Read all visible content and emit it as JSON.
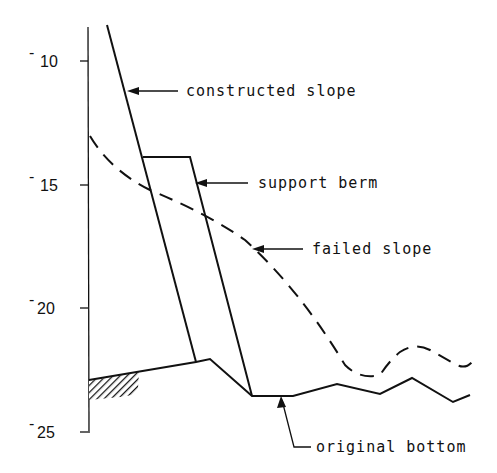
{
  "diagram": {
    "type": "cross-section profile",
    "y_axis": {
      "ticks": [
        {
          "value": "-10",
          "label": "10"
        },
        {
          "value": "-15",
          "label": "15"
        },
        {
          "value": "-20",
          "label": "20"
        },
        {
          "value": "-25",
          "label": "25"
        }
      ]
    },
    "labels": {
      "constructed_slope": "constructed slope",
      "support_berm": "support berm",
      "failed_slope": "failed slope",
      "original_bottom": "original bottom"
    },
    "colors": {
      "line": "#111111",
      "background": "#ffffff"
    }
  }
}
